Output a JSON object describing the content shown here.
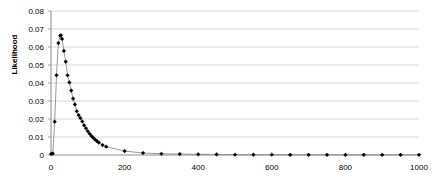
{
  "chart_data": {
    "type": "line",
    "title": "",
    "subtitle": "",
    "xlabel": "",
    "ylabel": "Likelihood",
    "xlim": [
      0,
      1000
    ],
    "ylim": [
      0,
      0.08
    ],
    "grid": true,
    "grid_axis": "y",
    "legend": false,
    "legend_position": "none",
    "marker": "diamond",
    "marker_color": "#000000",
    "line_color": "#808080",
    "gridline_color": "#c8c8c8",
    "axis_color": "#808080",
    "xticks": [
      0,
      200,
      400,
      600,
      800,
      1000
    ],
    "xtick_labels": [
      "0",
      "200",
      "400",
      "600",
      "800",
      "1000"
    ],
    "yticks": [
      0,
      0.01,
      0.02,
      0.03,
      0.04,
      0.05,
      0.06,
      0.07,
      0.08
    ],
    "ytick_labels": [
      "0",
      "0.01",
      "0.02",
      "0.03",
      "0.04",
      "0.05",
      "0.06",
      "0.07",
      "0.08"
    ],
    "series": [
      {
        "name": "Likelihood",
        "x": [
          0,
          5,
          10,
          15,
          20,
          25,
          27,
          30,
          35,
          40,
          45,
          50,
          55,
          60,
          65,
          70,
          75,
          80,
          85,
          90,
          95,
          100,
          105,
          110,
          115,
          120,
          125,
          130,
          140,
          150,
          200,
          250,
          300,
          350,
          400,
          450,
          500,
          550,
          600,
          650,
          700,
          750,
          800,
          850,
          900,
          950,
          1000
        ],
        "values": [
          0.0006,
          0.0008,
          0.0185,
          0.0443,
          0.0622,
          0.0663,
          0.0665,
          0.0645,
          0.0578,
          0.0519,
          0.0443,
          0.0403,
          0.0358,
          0.0313,
          0.0281,
          0.0243,
          0.0222,
          0.0205,
          0.0186,
          0.0165,
          0.0148,
          0.0132,
          0.0118,
          0.0105,
          0.0095,
          0.0085,
          0.0077,
          0.0069,
          0.0055,
          0.0046,
          0.0022,
          0.0011,
          0.0007,
          0.0005,
          0.0004,
          0.0003,
          0.0002,
          0.0002,
          0.0002,
          0.0001,
          0.0001,
          0.0001,
          0.0001,
          0.0001,
          0.0001,
          0.0001,
          0.0001
        ]
      }
    ]
  },
  "plot": {
    "left": 51,
    "right": 419,
    "top": 11,
    "bottom": 155
  }
}
